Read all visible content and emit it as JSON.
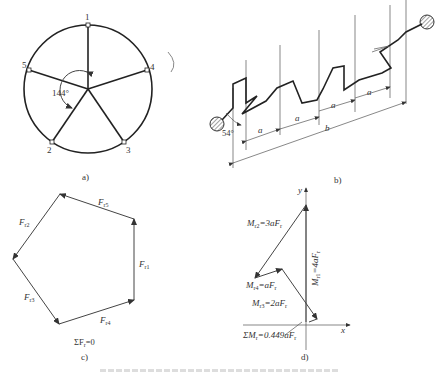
{
  "panel_a": {
    "caption": "a)",
    "angle_label": "144°",
    "points": [
      "1",
      "2",
      "3",
      "4",
      "5"
    ]
  },
  "panel_b": {
    "caption": "b)",
    "angle_label": "54°",
    "dim_a": "a",
    "dim_b": "b"
  },
  "panel_c": {
    "caption": "c)",
    "labels": {
      "f1": "F",
      "f1s": "r1",
      "f2": "F",
      "f2s": "r2",
      "f3": "F",
      "f3s": "r3",
      "f4": "F",
      "f4s": "r4",
      "f5": "F",
      "f5s": "r5"
    },
    "sum": "ΣF",
    "sum_sub": "r",
    "sum_eq": "=0"
  },
  "panel_d": {
    "caption": "d)",
    "axis_x": "x",
    "axis_y": "y",
    "m1": "M",
    "m1s": "r1",
    "m1v": "=4aF",
    "m1vs": "r",
    "m2": "M",
    "m2s": "r2",
    "m2v": "=3aF",
    "m2vs": "r",
    "m3": "M",
    "m3s": "r3",
    "m3v": "=2aF",
    "m3vs": "r",
    "m4": "M",
    "m4s": "r4",
    "m4v": "=aF",
    "m4vs": "r",
    "sum": "ΣM",
    "sums": "r",
    "sumv": "=0.449aF",
    "sumvs": "r"
  }
}
